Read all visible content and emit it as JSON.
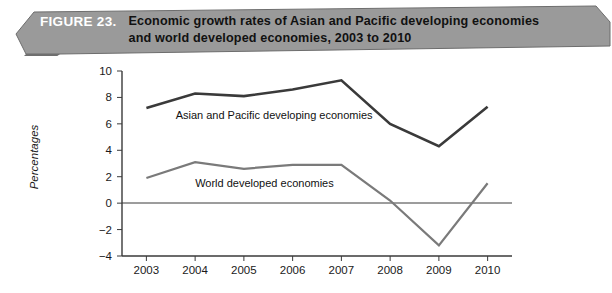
{
  "figure": {
    "label": "FIGURE 23.",
    "title_line1": "Economic growth rates of Asian and Pacific developing economies",
    "title_line2": "and world developed economies, 2003 to 2010",
    "banner_fill": "#9a9a9a",
    "banner_label_color": "#ffffff",
    "banner_title_color": "#111111"
  },
  "chart_data": {
    "type": "line",
    "title": "Economic growth rates of Asian and Pacific developing economies and world developed economies, 2003 to 2010",
    "xlabel": "",
    "ylabel": "Percentages",
    "categories": [
      "2003",
      "2004",
      "2005",
      "2006",
      "2007",
      "2008",
      "2009",
      "2010"
    ],
    "x": [
      2003,
      2004,
      2005,
      2006,
      2007,
      2008,
      2009,
      2010
    ],
    "ylim": [
      -4,
      10
    ],
    "yticks": [
      -4,
      -2,
      0,
      2,
      4,
      6,
      8,
      10
    ],
    "ytick_labels": [
      "−4",
      "−2",
      "0",
      "2",
      "4",
      "6",
      "8",
      "10"
    ],
    "grid": false,
    "legend": "inline-annotations",
    "zero_line": true,
    "series": [
      {
        "name": "Asian and Pacific developing economies",
        "color": "#3a3a3a",
        "width": 2.6,
        "values": [
          7.2,
          8.3,
          8.1,
          8.6,
          9.3,
          6.0,
          4.3,
          7.3
        ]
      },
      {
        "name": "World developed economies",
        "color": "#7a7a7a",
        "width": 2.2,
        "values": [
          1.9,
          3.1,
          2.6,
          2.9,
          2.9,
          0.2,
          -3.2,
          1.5
        ]
      }
    ],
    "annotations": [
      {
        "text": "Asian and Pacific developing economies",
        "x": 2003.6,
        "y": 6.4
      },
      {
        "text": "World developed economies",
        "x": 2004.0,
        "y": 1.2
      }
    ]
  }
}
